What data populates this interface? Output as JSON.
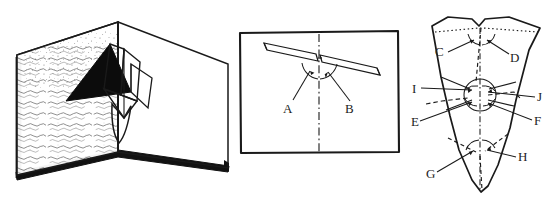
{
  "figure": {
    "background_color": "#ffffff",
    "ink_color": "#1a1a1a",
    "panel_count": 3
  },
  "panels": [
    {
      "id": "book",
      "name": "open-book-popup-view",
      "description": "Open book / greeting card shown in perspective with a white folded pop-up form rising from the gutter; the left page carries scribbled handwriting texture and a solid black cast-shadow triangle.",
      "features": {
        "left_page": "handwriting-texture",
        "spine": "center-fold",
        "popup": "white-folded-wing-form",
        "shadow": "solid-black-triangle",
        "page_edge": "thick-black-bottom-edge"
      }
    },
    {
      "id": "front",
      "name": "front-elevation-view",
      "description": "Rectangular frame containing a front elevation of the pop-up wings with a vertical dash-dot centerline and two marked angles.",
      "frame": "rectangle",
      "centerline_style": "dash-dot",
      "angles": [
        {
          "label": "A",
          "side": "left"
        },
        {
          "label": "B",
          "side": "right"
        }
      ]
    },
    {
      "id": "flat",
      "name": "flat-pattern-template",
      "description": "Unfolded flat pattern / cut template of the pop-up with dotted and dashed fold lines and five angle clusters labelled in pairs.",
      "fold_line_styles": [
        "dotted",
        "dashed",
        "dash-dot"
      ],
      "angles": [
        {
          "label": "C",
          "cluster": "top",
          "side": "left"
        },
        {
          "label": "D",
          "cluster": "top",
          "side": "right"
        },
        {
          "label": "I",
          "cluster": "middle",
          "side": "left-upper"
        },
        {
          "label": "J",
          "cluster": "middle",
          "side": "right-upper"
        },
        {
          "label": "E",
          "cluster": "middle",
          "side": "left-lower"
        },
        {
          "label": "F",
          "cluster": "middle",
          "side": "right-lower"
        },
        {
          "label": "G",
          "cluster": "bottom",
          "side": "left"
        },
        {
          "label": "H",
          "cluster": "bottom",
          "side": "right"
        }
      ]
    }
  ],
  "labels": {
    "A": "A",
    "B": "B",
    "C": "C",
    "D": "D",
    "E": "E",
    "F": "F",
    "G": "G",
    "H": "H",
    "I": "I",
    "J": "J"
  }
}
